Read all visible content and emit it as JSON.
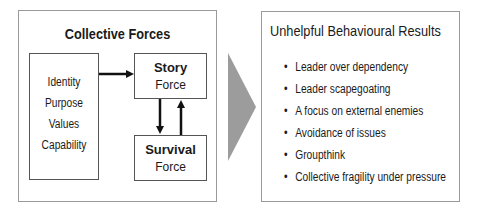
{
  "left_panel": {
    "title": "Collective Forces",
    "attributes": [
      "Identity",
      "Purpose",
      "Values",
      "Capability"
    ],
    "story": {
      "title": "Story",
      "subtitle": "Force"
    },
    "survival": {
      "title": "Survival",
      "subtitle": "Force"
    }
  },
  "connector": {
    "icon": "chevron-right-icon",
    "color": "#9c9c9c"
  },
  "right_panel": {
    "title": "Unhelpful Behavioural Results",
    "items": [
      "Leader over dependency",
      "Leader scapegoating",
      "A focus on external enemies",
      "Avoidance of issues",
      "Groupthink",
      "Collective fragility under pressure"
    ]
  }
}
